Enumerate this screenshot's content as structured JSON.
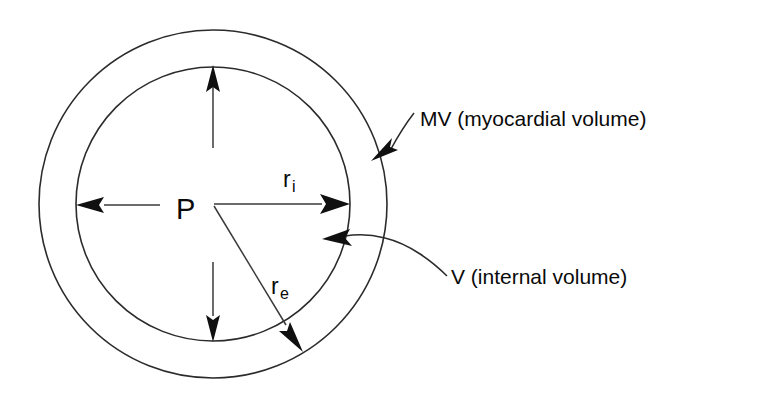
{
  "figure": {
    "type": "annotated-schematic-diagram",
    "background_color": "#ffffff",
    "line_color": "#2b2b2b"
  },
  "geometry": {
    "center_x": 213,
    "center_y": 204,
    "inner_radius": 137,
    "outer_radius": 174
  },
  "labels": {
    "pressure": "P",
    "inner_radius_symbol": "r",
    "inner_radius_subscript": "i",
    "outer_radius_symbol": "r",
    "outer_radius_subscript": "e",
    "myocardial_volume": "MV (myocardial volume)",
    "internal_volume": "V (internal volume)"
  },
  "annotations": {
    "pressure_arrows": [
      {
        "name": "pressure-arrow-up",
        "direction": "up"
      },
      {
        "name": "pressure-arrow-down",
        "direction": "down"
      },
      {
        "name": "pressure-arrow-left",
        "direction": "left"
      }
    ],
    "radius_arrows": [
      {
        "name": "radius-inner-arrow",
        "direction": "right",
        "label": "r_i",
        "target": "inner-circle"
      },
      {
        "name": "radius-outer-arrow",
        "direction": "down-right",
        "label": "r_e",
        "target": "outer-circle"
      }
    ],
    "leaders": [
      {
        "name": "myocardial-volume-leader",
        "points_to": "myocardial-wall-band"
      },
      {
        "name": "internal-volume-leader",
        "points_to": "internal-cavity"
      }
    ]
  }
}
